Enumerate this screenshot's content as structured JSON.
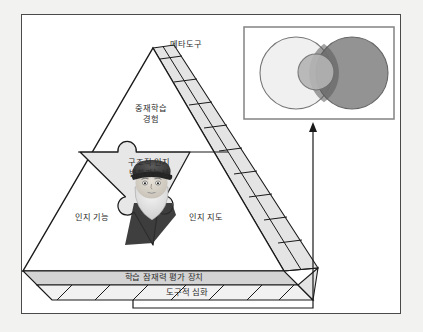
{
  "figure": {
    "type": "conceptual-diagram",
    "outer_background": "#f2f2f0",
    "frame_border_color": "#4a4a4a",
    "frame_background": "#ffffff"
  },
  "pyramid": {
    "apex_label": "메타도구",
    "upper_label": "중재학습\n경험",
    "upper_label_line1": "중재학습",
    "upper_label_line2": "경험",
    "core_label_line1": "구조적 인지",
    "core_label_line2": "변화가능성",
    "left_label": "인지 기능",
    "right_label": "인지 지도",
    "base_band_label": "학습 잠재력 평가 장치",
    "base_lower_label": "도구적 심화",
    "face_fill": "#ffffff",
    "side_fill": "#e3e3e3",
    "core_fill": "#e6e6e6",
    "band_fill": "#d2d2d2",
    "outline_color": "#1a1a1a"
  },
  "portrait": {
    "name": "bearded-scholar-portrait",
    "description": "grayscale portrait of a bearded man wearing a flat cap",
    "cap_color": "#3a3a3a",
    "beard_color": "#e8e8e8",
    "skin_color": "#d9d4cc"
  },
  "venn": {
    "panel_border_color": "#8a8a8a",
    "panel_background": "#ffffff",
    "circles": [
      {
        "name": "large-light-circle",
        "fill": "#f0f0f0",
        "stroke": "#777777"
      },
      {
        "name": "inner-medium-circle",
        "fill": "#b4b4b4",
        "stroke": "#6e6e6e"
      },
      {
        "name": "large-dark-circle",
        "fill": "#8a8a8a",
        "stroke": "#5a5a5a"
      }
    ],
    "overlap_fill": "#555555"
  },
  "connector": {
    "name": "arrow-to-venn",
    "direction": "up",
    "line_color": "#1a1a1a"
  }
}
